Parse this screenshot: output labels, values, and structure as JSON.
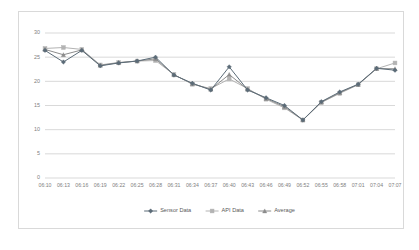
{
  "chart_data": {
    "type": "line",
    "title": "",
    "xlabel": "",
    "ylabel": "",
    "ylim": [
      0,
      30
    ],
    "yticks": [
      0,
      5,
      10,
      15,
      20,
      25,
      30
    ],
    "grid": "horizontal",
    "legend_position": "bottom",
    "categories": [
      "06:10",
      "06:13",
      "06:16",
      "06:19",
      "06:22",
      "06:25",
      "06:28",
      "06:31",
      "06:34",
      "06:37",
      "06:40",
      "06:43",
      "06:46",
      "06:49",
      "06:52",
      "06:55",
      "06:58",
      "07:01",
      "07:04",
      "07:07"
    ],
    "series": [
      {
        "name": "Sensor Data",
        "color": "#5b6b77",
        "marker": "diamond",
        "values": [
          26.4,
          24.0,
          26.4,
          23.2,
          23.8,
          24.2,
          25.0,
          21.3,
          19.6,
          18.2,
          23.0,
          18.2,
          16.6,
          15.0,
          12.0,
          15.8,
          17.8,
          19.4,
          22.7,
          22.3
        ]
      },
      {
        "name": "API Data",
        "color": "#b3b3b3",
        "marker": "square",
        "values": [
          26.8,
          27.0,
          26.6,
          23.4,
          23.9,
          24.2,
          24.3,
          21.4,
          19.4,
          18.5,
          20.5,
          18.5,
          16.3,
          14.5,
          12.0,
          15.6,
          17.5,
          19.3,
          22.6,
          23.8
        ]
      },
      {
        "name": "Average",
        "color": "#8c8c8c",
        "marker": "triangle",
        "values": [
          26.6,
          25.5,
          26.5,
          23.3,
          23.85,
          24.2,
          24.65,
          21.35,
          19.5,
          18.35,
          21.4,
          18.35,
          16.45,
          14.75,
          12.0,
          15.7,
          17.65,
          19.35,
          22.65,
          22.6
        ]
      }
    ]
  },
  "axis": {
    "y_label_color": "#808080",
    "x_label_color": "#808080",
    "gridline_color": "#bfbfbf"
  },
  "frame": {
    "border_color": "#d9d9d9",
    "background": "#ffffff"
  }
}
